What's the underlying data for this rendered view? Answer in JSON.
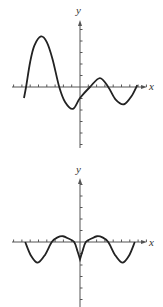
{
  "chart_data": [
    {
      "type": "line",
      "title": "",
      "xlabel": "x",
      "ylabel": "y",
      "grid": false,
      "xlim": [
        -8.2,
        8.1
      ],
      "ylim": [
        -5.3,
        5.8
      ],
      "x_ticks": [
        -8,
        -7,
        -6,
        -5,
        -4,
        -3,
        -2,
        -1,
        1,
        2,
        3,
        4,
        5,
        6,
        7,
        8
      ],
      "y_ticks": [
        -5,
        -4,
        -3,
        -2,
        -1,
        1,
        2,
        3,
        4,
        5
      ],
      "series": [
        {
          "name": "curve",
          "points": [
            [
              -6.75,
              -0.96
            ],
            [
              -6.5,
              0
            ],
            [
              -6.0,
              2.2
            ],
            [
              -5.5,
              3.6
            ],
            [
              -4.7,
              4.4
            ],
            [
              -4.0,
              3.9
            ],
            [
              -3.3,
              2.4
            ],
            [
              -2.5,
              0
            ],
            [
              -1.8,
              -1.3
            ],
            [
              -0.85,
              -1.9
            ],
            [
              0,
              -0.96
            ],
            [
              1.2,
              0
            ],
            [
              2.4,
              0.78
            ],
            [
              3.4,
              0
            ],
            [
              4.3,
              -1.1
            ],
            [
              5.3,
              -1.5
            ],
            [
              6.2,
              -0.8
            ],
            [
              6.9,
              0.17
            ]
          ]
        }
      ],
      "key_points": {
        "local_max": [
          -4.7,
          4.4
        ],
        "local_min_1": [
          -0.85,
          -1.9
        ],
        "y_intercept": [
          0,
          -0.96
        ],
        "local_max_2": [
          2.4,
          0.78
        ],
        "local_min_2": [
          5.3,
          -1.5
        ],
        "x_intercepts": [
          -6.5,
          -2.5,
          1.2,
          3.4
        ]
      }
    },
    {
      "type": "line",
      "title": "",
      "xlabel": "x",
      "ylabel": "y",
      "grid": false,
      "xlim": [
        -8.2,
        8.1
      ],
      "ylim": [
        -5.7,
        5.6
      ],
      "x_ticks": [
        -8,
        -7,
        -6,
        -5,
        -4,
        -3,
        -2,
        -1,
        1,
        2,
        3,
        4,
        5,
        6,
        7,
        8
      ],
      "y_ticks": [
        -5,
        -4,
        -3,
        -2,
        -1,
        1,
        2,
        3,
        4,
        5
      ],
      "series": [
        {
          "name": "curve",
          "points": [
            [
              -6.6,
              0
            ],
            [
              -5.9,
              -1.2
            ],
            [
              -5.1,
              -1.8
            ],
            [
              -4.2,
              -1.1
            ],
            [
              -3.4,
              0
            ],
            [
              -2.7,
              0.4
            ],
            [
              -2.05,
              0.5
            ],
            [
              -1.4,
              0.3
            ],
            [
              -0.7,
              0
            ],
            [
              -0.3,
              -0.8
            ],
            [
              0,
              -1.5
            ],
            [
              0.3,
              -0.8
            ],
            [
              0.7,
              0
            ],
            [
              1.4,
              0.3
            ],
            [
              2.05,
              0.5
            ],
            [
              2.7,
              0.4
            ],
            [
              3.4,
              0
            ],
            [
              4.2,
              -1.1
            ],
            [
              5.1,
              -1.8
            ],
            [
              5.9,
              -1.2
            ],
            [
              6.6,
              0
            ]
          ]
        }
      ],
      "key_points": {
        "cusp_min": [
          0,
          -1.5
        ],
        "local_max": [
          [
            -2.05,
            0.5
          ],
          [
            2.05,
            0.5
          ]
        ],
        "local_min": [
          [
            -5.1,
            -1.8
          ],
          [
            5.1,
            -1.8
          ]
        ],
        "x_intercepts": [
          -6.6,
          -3.4,
          -0.7,
          0.7,
          3.4,
          6.6
        ]
      }
    }
  ],
  "graphs": {
    "top": {
      "x_label": "x",
      "y_label": "y"
    },
    "bottom": {
      "x_label": "x",
      "y_label": "y"
    }
  },
  "layout": {
    "top": {
      "origin_px": [
        80,
        87
      ],
      "x_unit_px": 8.3,
      "y_unit_px": 11.5,
      "x_axis_px": [
        12,
        147
      ],
      "y_axis_px": [
        20,
        148
      ]
    },
    "bottom": {
      "origin_px": [
        80,
        87
      ],
      "x_unit_px": 8.3,
      "y_unit_px": 11.5,
      "x_axis_px": [
        12,
        147
      ],
      "y_axis_px": [
        23,
        152
      ]
    }
  },
  "colors": {
    "axis": "#555555",
    "curve": "#222222",
    "text": "#333333"
  }
}
